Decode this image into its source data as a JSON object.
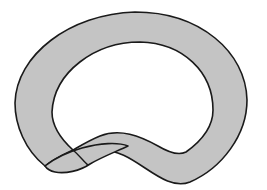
{
  "figure": {
    "colors": {
      "background": "#ffffff",
      "band_fill": "#c4c4c4",
      "outline": "#1a1a1a"
    }
  }
}
